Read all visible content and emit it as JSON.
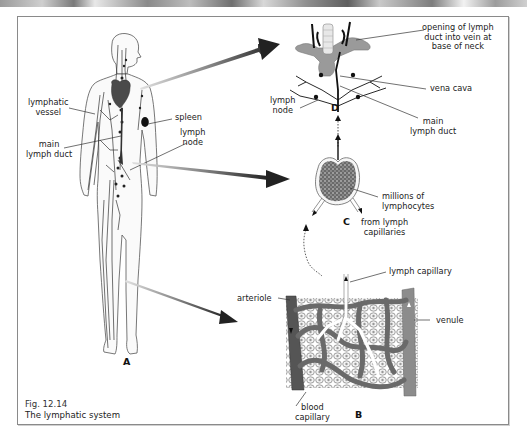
{
  "figure": {
    "number": "Fig. 12.14",
    "title": "The lymphatic system"
  },
  "panels": {
    "A": {
      "letter": "A",
      "description": "human body with lymphatic vessels",
      "labels": {
        "lymphatic_vessel": "lymphatic\nvessel",
        "main_lymph_duct": "main\nlymph duct",
        "spleen": "spleen",
        "lymph_node": "lymph\nnode"
      }
    },
    "B": {
      "letter": "B",
      "description": "capillary bed",
      "labels": {
        "arteriole": "arteriole",
        "lymph_capillary": "lymph capillary",
        "venule": "venule",
        "blood_capillary": "blood\ncapillary"
      }
    },
    "C": {
      "letter": "C",
      "description": "lymph node cross-section",
      "labels": {
        "millions_of_lymphocytes": "millions of\nlymphocytes",
        "from_lymph_capillaries": "from lymph\ncapillaries"
      }
    },
    "D": {
      "letter": "D",
      "description": "duct entry into veins at neck",
      "labels": {
        "opening": "opening of lymph\nduct into vein at\nbase of neck",
        "vena_cava": "vena cava",
        "lymph_node": "lymph\nnode",
        "main_lymph_duct": "main\nlymph duct"
      }
    }
  },
  "colors": {
    "frame_border": "#8a8a8a",
    "arrow_dark": "#333333",
    "vessel_gray": "#7d7d7d",
    "arteriole": "#555555",
    "venule": "#8c8c8c",
    "heart": "#4a4a4a"
  }
}
